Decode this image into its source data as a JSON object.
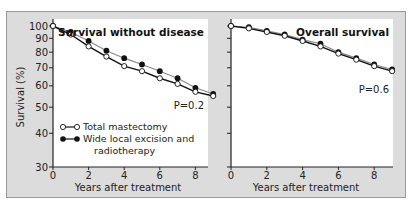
{
  "chart_data": [
    {
      "type": "line",
      "title": "Survival without disease",
      "xlabel": "Years after treatment",
      "ylabel": "Survival (%)",
      "y_scale": "log",
      "ylim": [
        30,
        100
      ],
      "xlim": [
        0,
        9
      ],
      "xticks": [
        0,
        2,
        4,
        6,
        8
      ],
      "yticks": [
        30,
        40,
        50,
        60,
        70,
        80,
        90,
        100
      ],
      "annotation": "P=0.2",
      "x": [
        0,
        1,
        2,
        3,
        4,
        5,
        6,
        7,
        8,
        9
      ],
      "series": [
        {
          "name": "Total mastectomy",
          "marker": "open-circle",
          "values": [
            100,
            93,
            84,
            77,
            71,
            68,
            64,
            61,
            57,
            55
          ]
        },
        {
          "name": "Wide local excision and radiotherapy",
          "marker": "filled-circle",
          "values": [
            100,
            95,
            88,
            81,
            76,
            72,
            68,
            64,
            59,
            56
          ]
        }
      ],
      "legend": {
        "position": "lower-left",
        "entries": [
          "Total mastectomy",
          "Wide local excision and radiotherapy"
        ]
      }
    },
    {
      "type": "line",
      "title": "Overall survival",
      "xlabel": "Years after treatment",
      "ylabel": "Survival (%)",
      "y_scale": "log",
      "ylim": [
        30,
        100
      ],
      "xlim": [
        0,
        9
      ],
      "xticks": [
        0,
        2,
        4,
        6,
        8
      ],
      "yticks": [
        30,
        40,
        50,
        60,
        70,
        80,
        90,
        100
      ],
      "annotation": "P=0.6",
      "x": [
        0,
        1,
        2,
        3,
        4,
        5,
        6,
        7,
        8,
        9
      ],
      "series": [
        {
          "name": "Total mastectomy",
          "marker": "open-circle",
          "values": [
            100,
            98,
            95,
            92,
            88,
            84,
            79,
            75,
            71,
            68
          ]
        },
        {
          "name": "Wide local excision and radiotherapy",
          "marker": "filled-circle",
          "values": [
            100,
            99,
            96,
            93,
            89,
            86,
            80,
            76,
            72,
            69
          ]
        }
      ]
    }
  ],
  "labels": {
    "ylabel": "Survival (%)",
    "xlabel": "Years after treatment",
    "left_title": "Survival without disease",
    "right_title": "Overall survival",
    "left_p": "P=0.2",
    "right_p": "P=0.6",
    "legend_1": "Total mastectomy",
    "legend_2_line1": "Wide local excision and",
    "legend_2_line2": "radiotherapy"
  },
  "colors": {
    "background": "#dcdcdc",
    "plot_area": "#ffffff",
    "line_dark": "#111111",
    "line_light": "#888888"
  }
}
